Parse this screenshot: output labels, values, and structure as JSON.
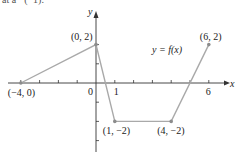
{
  "header_fragment": "at a⁻¹(−1).",
  "chart_data": {
    "type": "line",
    "title": "",
    "function_label": "y = f(x)",
    "xlabel": "x",
    "ylabel": "y",
    "xlim": [
      -4.5,
      7
    ],
    "ylim": [
      -3.5,
      4
    ],
    "grid": false,
    "legend": "none",
    "series": [
      {
        "name": "y = f(x)",
        "points": [
          [
            -4,
            0
          ],
          [
            0,
            2
          ],
          [
            1,
            -2
          ],
          [
            4,
            -2
          ],
          [
            6,
            2
          ]
        ]
      }
    ],
    "x_tick_values": [
      -4,
      -3,
      -2,
      -1,
      0,
      1,
      2,
      3,
      4,
      5,
      6
    ],
    "x_tick_labels": [
      {
        "value": 0,
        "label": "0"
      },
      {
        "value": 1,
        "label": "1"
      },
      {
        "value": 6,
        "label": "6"
      }
    ],
    "y_tick_values": [
      -3,
      -2,
      -1,
      1,
      2
    ],
    "annotations": [
      {
        "point": [
          -4,
          0
        ],
        "label": "(−4, 0)"
      },
      {
        "point": [
          0,
          2
        ],
        "label": "(0, 2)"
      },
      {
        "point": [
          1,
          -2
        ],
        "label": "(1, −2)"
      },
      {
        "point": [
          4,
          -2
        ],
        "label": "(4, −2)"
      },
      {
        "point": [
          6,
          2
        ],
        "label": "(6, 2)"
      }
    ]
  },
  "colors": {
    "axis": "#333333",
    "curve": "#a9a9a9",
    "point": "#8c8c8c",
    "text": "#222222"
  }
}
